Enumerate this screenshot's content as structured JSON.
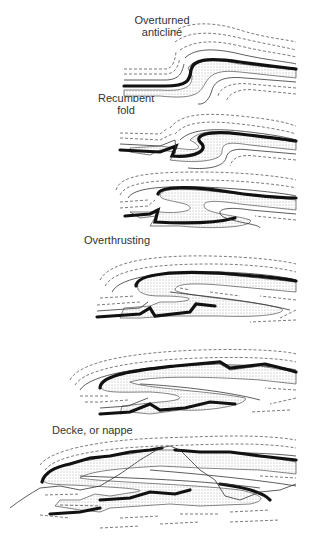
{
  "figure": {
    "labels": {
      "overturned_anticline": "Overturned anticline",
      "overturned_line1": "Overturned",
      "overturned_line2": "anticline",
      "recumbent_line1": "Recumbent",
      "recumbent_line2": "fold",
      "overthrusting": "Overthrusting",
      "nappe": "Decke, or nappe"
    },
    "stages": [
      {
        "name": "Overturned anticline",
        "order": 1
      },
      {
        "name": "Recumbent fold",
        "order": 2
      },
      {
        "name": "Recumbent fold (tightened)",
        "order": 3
      },
      {
        "name": "Overthrusting",
        "order": 4
      },
      {
        "name": "Overthrust (advanced)",
        "order": 5
      },
      {
        "name": "Decke, or nappe",
        "order": 6
      }
    ],
    "legend_styles": {
      "thick_bed": "#111111",
      "thin_bed": "#333333",
      "dashed_bed": "#444444",
      "stippled_sandstone": "#555555"
    }
  }
}
